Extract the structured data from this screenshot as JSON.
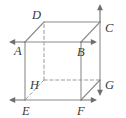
{
  "figure": {
    "kind": "cube-diagram",
    "background_color": "#ffffff",
    "line_color": "#8c8c8c",
    "dashed_line_color": "#9a9a9a",
    "label_color": "#3a3a3a",
    "arrow_color": "#6e6e6e",
    "canvas": {
      "width": 126,
      "height": 118
    },
    "vertices": [
      {
        "id": "A",
        "label": "A",
        "x": 25,
        "y": 42,
        "hidden": false,
        "label_dx": -11,
        "label_dy": 3,
        "arrow": "left"
      },
      {
        "id": "B",
        "label": "B",
        "x": 81,
        "y": 42,
        "hidden": false,
        "label_dx": -4,
        "label_dy": 4,
        "arrow": "right"
      },
      {
        "id": "C",
        "label": "C",
        "x": 100,
        "y": 22,
        "hidden": false,
        "label_dx": 5,
        "label_dy": 0,
        "arrow": "up"
      },
      {
        "id": "D",
        "label": "D",
        "x": 44,
        "y": 22,
        "hidden": false,
        "label_dx": -12,
        "label_dy": -13,
        "arrow": "none"
      },
      {
        "id": "E",
        "label": "E",
        "x": 25,
        "y": 100,
        "hidden": false,
        "label_dx": -3,
        "label_dy": 5,
        "arrow": "left"
      },
      {
        "id": "F",
        "label": "F",
        "x": 81,
        "y": 100,
        "hidden": false,
        "label_dx": -4,
        "label_dy": 5,
        "arrow": "right"
      },
      {
        "id": "G",
        "label": "G",
        "x": 100,
        "y": 80,
        "hidden": false,
        "label_dx": 5,
        "label_dy": -1,
        "arrow": "down"
      },
      {
        "id": "H",
        "label": "H",
        "x": 44,
        "y": 80,
        "hidden": true,
        "label_dx": -14,
        "label_dy": -1,
        "arrow": "none"
      }
    ],
    "solid_edges": [
      [
        "A",
        "B"
      ],
      [
        "B",
        "F"
      ],
      [
        "F",
        "E"
      ],
      [
        "E",
        "A"
      ],
      [
        "D",
        "C"
      ],
      [
        "C",
        "G"
      ],
      [
        "G",
        "F"
      ],
      [
        "A",
        "D"
      ],
      [
        "B",
        "C"
      ]
    ],
    "dashed_edges": [
      [
        "H",
        "D"
      ],
      [
        "H",
        "G"
      ],
      [
        "H",
        "E"
      ]
    ],
    "arrows": [
      {
        "vertex": "A",
        "direction": "left",
        "length": 16
      },
      {
        "vertex": "B",
        "direction": "right",
        "length": 16
      },
      {
        "vertex": "C",
        "direction": "up",
        "length": 18
      },
      {
        "vertex": "E",
        "direction": "left",
        "length": 16
      },
      {
        "vertex": "F",
        "direction": "right",
        "length": 16
      },
      {
        "vertex": "G",
        "direction": "down",
        "length": 16
      }
    ]
  }
}
